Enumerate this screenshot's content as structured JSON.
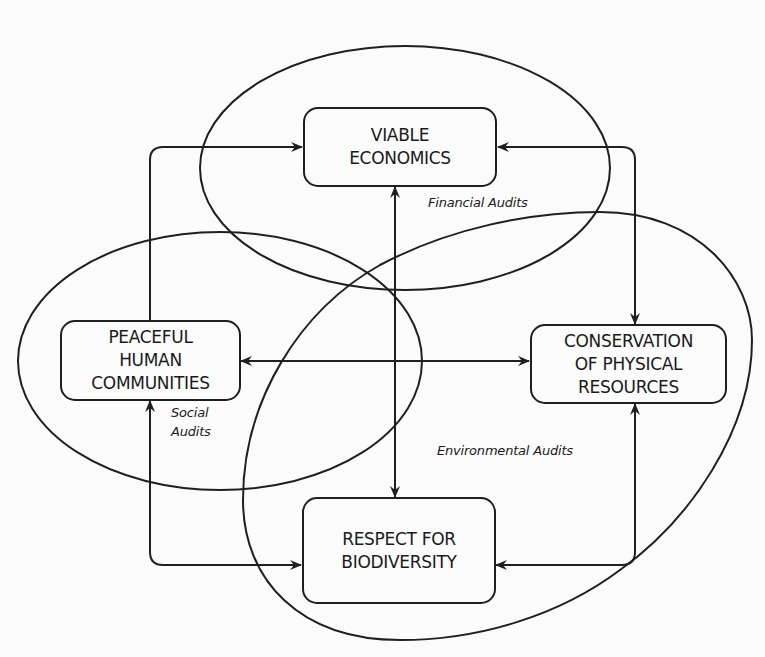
{
  "diagram": {
    "nodes": {
      "viable_economics": {
        "line1": "VIABLE",
        "line2": "ECONOMICS"
      },
      "peaceful_communities": {
        "line1": "PEACEFUL",
        "line2": "HUMAN",
        "line3": "COMMUNITIES"
      },
      "conservation": {
        "line1": "CONSERVATION",
        "line2": "OF PHYSICAL",
        "line3": "RESOURCES"
      },
      "biodiversity": {
        "line1": "RESPECT FOR",
        "line2": "BIODIVERSITY"
      }
    },
    "regions": {
      "financial": "Financial Audits",
      "social_line1": "Social",
      "social_line2": "Audits",
      "environmental": "Environmental Audits"
    },
    "edges": [
      {
        "from": "peaceful_communities",
        "to": "viable_economics",
        "type": "one-way"
      },
      {
        "from": "conservation",
        "to": "viable_economics",
        "type": "two-way"
      },
      {
        "from": "viable_economics",
        "to": "biodiversity",
        "type": "two-way"
      },
      {
        "from": "peaceful_communities",
        "to": "conservation",
        "type": "two-way"
      },
      {
        "from": "biodiversity",
        "to": "peaceful_communities",
        "type": "two-way"
      },
      {
        "from": "conservation",
        "to": "biodiversity",
        "type": "two-way"
      }
    ],
    "colors": {
      "stroke": "#1f1f1f",
      "background": "#fbfbfb",
      "text": "#1a1a1a"
    }
  }
}
